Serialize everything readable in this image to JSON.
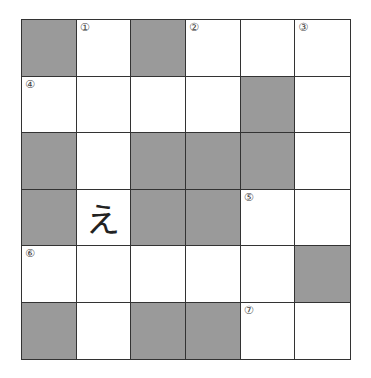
{
  "puzzle": {
    "rows": 6,
    "cols": 6,
    "colors": {
      "block": "#9a9a9a",
      "empty": "#ffffff",
      "line": "#333333"
    },
    "cells": [
      [
        {
          "black": true
        },
        {
          "num": "①"
        },
        {
          "black": true
        },
        {
          "num": "②"
        },
        {},
        {
          "num": "③"
        }
      ],
      [
        {
          "num": "④"
        },
        {},
        {},
        {},
        {
          "black": true
        },
        {}
      ],
      [
        {
          "black": true
        },
        {},
        {
          "black": true
        },
        {
          "black": true
        },
        {
          "black": true
        },
        {}
      ],
      [
        {
          "black": true
        },
        {
          "letter": "え"
        },
        {
          "black": true
        },
        {
          "black": true
        },
        {
          "num": "⑤"
        },
        {}
      ],
      [
        {
          "num": "⑥"
        },
        {},
        {},
        {},
        {},
        {
          "black": true
        }
      ],
      [
        {
          "black": true
        },
        {},
        {
          "black": true
        },
        {
          "black": true
        },
        {
          "num": "⑦"
        },
        {}
      ]
    ]
  }
}
